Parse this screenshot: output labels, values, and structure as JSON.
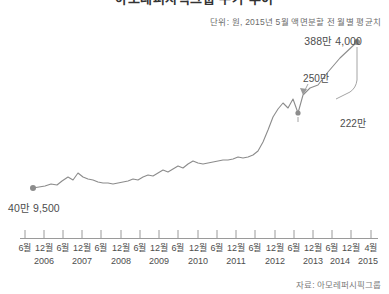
{
  "header": {
    "title": "아모레퍼시픽그룹 주가 추이",
    "subtitle": "단위: 원, 2015년 5월 액면분할 전 월별 평균치"
  },
  "footer": {
    "source": "자료: 아모레퍼시픽그룹"
  },
  "annotations": {
    "start": "40만 9,500",
    "end": "388만 4,000",
    "peak": "250만",
    "dip": "222만"
  },
  "colors": {
    "line": "#8c8c8c",
    "marker": "#8c8c8c",
    "axis": "#9a9a9a",
    "text": "#4d4d4d",
    "muted": "#7a7a7a"
  },
  "chart_data": {
    "type": "line",
    "title": "아모레퍼시픽그룹 주가 추이",
    "subtitle": "단위: 원, 2015년 5월 액면분할 전 월별 평균치",
    "xlabel": "",
    "ylabel": "",
    "grid": false,
    "legend": false,
    "ylim": [
      0,
      4000000
    ],
    "xlim": [
      "2006-06",
      "2015-04"
    ],
    "axis_ticks": [
      {
        "month": "6월",
        "year": "2006"
      },
      {
        "month": "12월",
        "year": ""
      },
      {
        "month": "6월",
        "year": "2007"
      },
      {
        "month": "12월",
        "year": ""
      },
      {
        "month": "6월",
        "year": "2008"
      },
      {
        "month": "12월",
        "year": ""
      },
      {
        "month": "6월",
        "year": "2009"
      },
      {
        "month": "12월",
        "year": ""
      },
      {
        "month": "6월",
        "year": "2010"
      },
      {
        "month": "12월",
        "year": ""
      },
      {
        "month": "6월",
        "year": "2011"
      },
      {
        "month": "12월",
        "year": ""
      },
      {
        "month": "6월",
        "year": "2012"
      },
      {
        "month": "12월",
        "year": ""
      },
      {
        "month": "6월",
        "year": "2013"
      },
      {
        "month": "12월",
        "year": ""
      },
      {
        "month": "6월",
        "year": "2014"
      },
      {
        "month": "12월",
        "year": ""
      },
      {
        "month": "4월",
        "year": "2015"
      }
    ],
    "year_positions": [
      {
        "year": "2006",
        "x": 44
      },
      {
        "year": "2007",
        "x": 82
      },
      {
        "year": "2008",
        "x": 121
      },
      {
        "year": "2009",
        "x": 159
      },
      {
        "year": "2010",
        "x": 198
      },
      {
        "year": "2011",
        "x": 236
      },
      {
        "year": "2012",
        "x": 275
      },
      {
        "year": "2013",
        "x": 313
      },
      {
        "year": "2014",
        "x": 340
      },
      {
        "year": "2015",
        "x": 368
      }
    ],
    "labeled_points": [
      {
        "label": "40만 9,500",
        "value": 409500,
        "x": "2006-06"
      },
      {
        "label": "250만",
        "value": 2500000,
        "x": "2014-09"
      },
      {
        "label": "222만",
        "value": 2220000,
        "x": "2014-11"
      },
      {
        "label": "388만 4,000",
        "value": 3884000,
        "x": "2015-04"
      }
    ],
    "series": [
      {
        "name": "월별 평균 주가",
        "values": [
          409500,
          415000,
          430000,
          470000,
          455000,
          520000,
          610000,
          560000,
          700000,
          640000,
          600000,
          575000,
          545000,
          530000,
          520000,
          515000,
          520000,
          540000,
          560000,
          590000,
          575000,
          620000,
          660000,
          640000,
          700000,
          760000,
          720000,
          780000,
          840000,
          800000,
          870000,
          930000,
          900000,
          880000,
          900000,
          920000,
          930000,
          950000,
          960000,
          980000,
          1010000,
          1000000,
          1020000,
          1060000,
          1130000,
          1400000,
          1700000,
          2050000,
          2250000,
          2420000,
          2300000,
          2500000,
          2220000,
          2600000,
          2750000,
          2800000,
          3200000,
          3600000,
          3884000
        ]
      }
    ]
  }
}
